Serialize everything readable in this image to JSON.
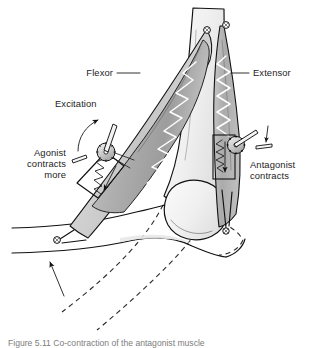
{
  "figure": {
    "background_color": "#ffffff",
    "width": 310,
    "height": 348,
    "caption": "Figure 5.11  Co-contraction of the antagonist muscle",
    "caption_visible_fragment": "Figure 5.11  Co…",
    "caption_color": "#7d7d7d"
  },
  "labels": [
    {
      "id": "flexor",
      "text": "Flexor",
      "x": 113,
      "y": 76,
      "anchor": "end",
      "lines": [
        "Flexor"
      ],
      "leader": true
    },
    {
      "id": "extensor",
      "text": "Extensor",
      "x": 253,
      "y": 76,
      "anchor": "start",
      "lines": [
        "Extensor"
      ],
      "leader": true
    },
    {
      "id": "excitation",
      "text": "Excitation",
      "x": 55,
      "y": 107,
      "anchor": "start",
      "lines": [
        "Excitation"
      ],
      "leader": false
    },
    {
      "id": "agonist",
      "text": "Agonist contracts more",
      "x": 66,
      "y": 156,
      "anchor": "end",
      "lines": [
        "Agonist",
        "contracts",
        "more"
      ],
      "leader": false
    },
    {
      "id": "antagonist",
      "text": "Antagonist contracts",
      "x": 250,
      "y": 168,
      "anchor": "start",
      "lines": [
        "Antagonist",
        "contracts"
      ],
      "leader": false
    }
  ],
  "colors": {
    "ink": "#111111",
    "muscle_fill_light": "#d2d2d2",
    "muscle_fill_mid": "#b4b4b4",
    "muscle_fill_dark": "#9a9a9a",
    "bone_fill": "#f1f1f1",
    "bone_shadow": "#dcdcdc",
    "spring_stroke": "#ffffff",
    "text": "#1c1c1c",
    "dashed_outline": "#2b2b2b",
    "background": "#ffffff"
  },
  "elements": {
    "flexor_muscle": {
      "name": "flexor muscle belly",
      "role": "agonist",
      "spring_coils": 9,
      "fill": "#b4b4b4"
    },
    "extensor_muscle": {
      "name": "extensor muscle belly",
      "role": "antagonist",
      "spring_coils": 8,
      "fill": "#b4b4b4"
    },
    "flexor_actuator": {
      "name": "agonist gear and lever actuator",
      "has_gear": true,
      "has_lever": true,
      "has_spring_box": true,
      "arrow_direction": "down"
    },
    "extensor_actuator": {
      "name": "antagonist gear and lever actuator",
      "has_gear": true,
      "has_lever": true,
      "has_spring_box": true,
      "arrow_direction": "down"
    },
    "excitation_arrow": {
      "name": "curved excitation arrow",
      "direction": "counter-clockwise up"
    },
    "motion_arrow": {
      "name": "limb motion arrow",
      "direction": "up-left"
    },
    "dashed_limb": {
      "name": "dashed outline of extended limb position"
    },
    "pivots": [
      {
        "id": "flexor-upper-anchor",
        "x": 207,
        "y": 30
      },
      {
        "id": "extensor-upper-anchor",
        "x": 226,
        "y": 25
      },
      {
        "id": "flexor-lower-anchor",
        "x": 57,
        "y": 240
      },
      {
        "id": "extensor-lower-anchor",
        "x": 226,
        "y": 231
      }
    ]
  }
}
